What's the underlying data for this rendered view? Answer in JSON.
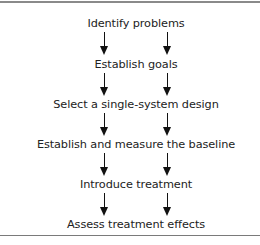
{
  "diagram": {
    "type": "vertical flowchart with parallel arrows",
    "steps": [
      {
        "label": "Identify problems"
      },
      {
        "label": "Establish goals"
      },
      {
        "label": "Select a single-system design"
      },
      {
        "label": "Establish and measure the baseline"
      },
      {
        "label": "Introduce treatment"
      },
      {
        "label": "Assess treatment effects"
      }
    ],
    "connector_icon": "down-arrow-icon",
    "arrows_per_gap": 2
  }
}
